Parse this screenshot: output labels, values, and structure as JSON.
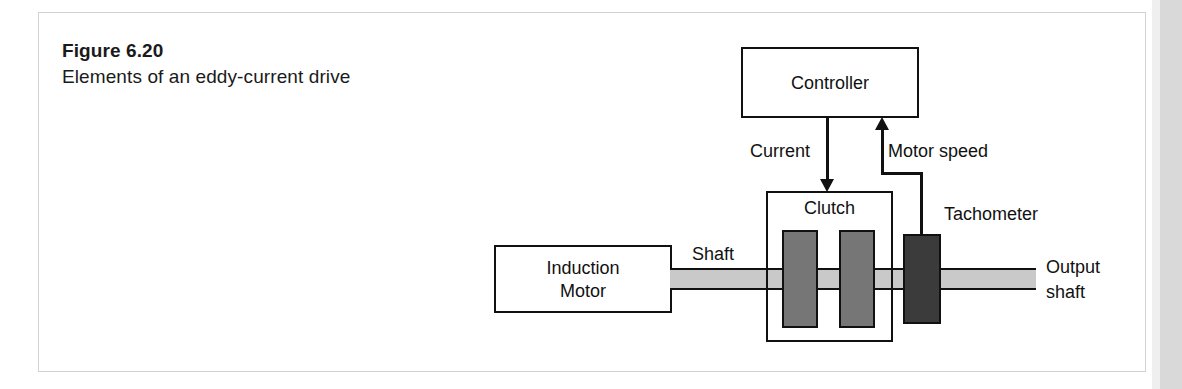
{
  "figure": {
    "number_label": "Figure 6.20",
    "title": "Elements of an eddy-current drive"
  },
  "diagram": {
    "blocks": {
      "controller": "Controller",
      "clutch": "Clutch",
      "induction_motor_line1": "Induction",
      "induction_motor_line2": "Motor",
      "tachometer": "Tachometer"
    },
    "labels": {
      "current": "Current",
      "motor_speed": "Motor speed",
      "shaft": "Shaft",
      "output_shaft_line1": "Output",
      "output_shaft_line2": "shaft"
    },
    "colors": {
      "outline": "#111111",
      "shaft_fill": "#c9c9c9",
      "clutch_disc_fill": "#767676",
      "tachometer_fill": "#3b3b3b",
      "page_background": "#ffffff",
      "scan_edge": "#d9d9d9"
    },
    "signal_flow": [
      "Controller -> Current -> Clutch",
      "Tachometer -> Motor speed -> Controller"
    ]
  }
}
